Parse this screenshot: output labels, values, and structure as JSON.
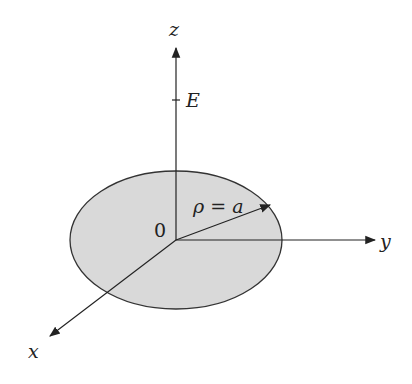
{
  "diagram": {
    "axes": {
      "z_label": "z",
      "y_label": "y",
      "x_label": "x",
      "origin_label": "0"
    },
    "field_label": "E",
    "radius_label": "ρ = a",
    "colors": {
      "disk_fill": "#d9d9d9",
      "stroke": "#222222",
      "background": "#ffffff"
    }
  }
}
